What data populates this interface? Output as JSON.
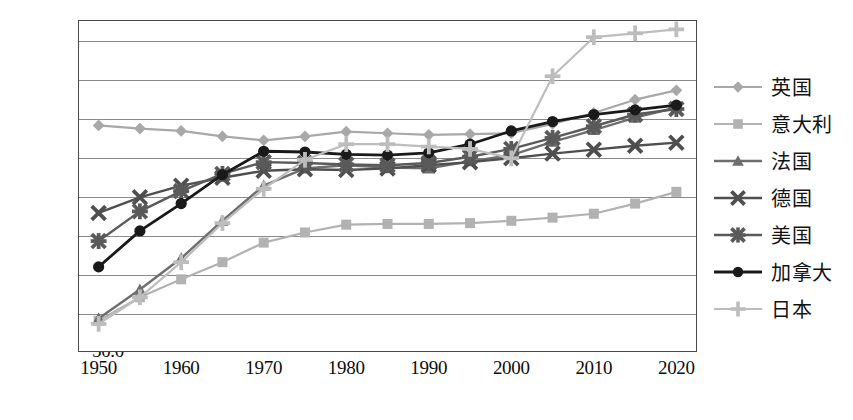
{
  "chart_data": {
    "type": "line",
    "title": "",
    "xlabel": "",
    "ylabel": "",
    "x": [
      1950,
      1955,
      1960,
      1965,
      1970,
      1975,
      1980,
      1985,
      1990,
      1995,
      2000,
      2005,
      2010,
      2015,
      2020
    ],
    "xlim": [
      1947.5,
      2022.5
    ],
    "ylim": [
      50.0,
      92.5
    ],
    "grid": true,
    "legend_position": "right",
    "y_ticks": [
      "90.0",
      "85.0",
      "80.0",
      "75.0",
      "70.0",
      "65.0",
      "60.0",
      "55.0",
      "50.0"
    ],
    "y_tick_values": [
      90.0,
      85.0,
      80.0,
      75.0,
      70.0,
      65.0,
      60.0,
      55.0,
      50.0
    ],
    "x_ticks": [
      "1950",
      "1960",
      "1970",
      "1980",
      "1990",
      "2000",
      "2010",
      "2020"
    ],
    "x_tick_values": [
      1950,
      1960,
      1970,
      1980,
      1990,
      2000,
      2010,
      2020
    ],
    "series": [
      {
        "name": "英国",
        "marker": "diamond",
        "color": "#a8a8a8",
        "line_width": 2.2,
        "values": [
          79.0,
          78.6,
          78.3,
          77.6,
          77.1,
          77.6,
          78.2,
          78.0,
          77.8,
          77.9,
          78.0,
          79.2,
          80.6,
          82.3,
          83.5
        ]
      },
      {
        "name": "意大利",
        "marker": "square",
        "color": "#b2b2b2",
        "line_width": 2.2,
        "values": [
          54.0,
          57.0,
          59.3,
          61.5,
          64.0,
          65.3,
          66.3,
          66.4,
          66.4,
          66.5,
          66.8,
          67.2,
          67.7,
          69.0,
          70.5
        ]
      },
      {
        "name": "法国",
        "marker": "triangle",
        "color": "#6e6e6e",
        "line_width": 2.4,
        "values": [
          54.3,
          58.0,
          62.0,
          66.8,
          71.3,
          73.5,
          73.9,
          73.6,
          73.5,
          74.4,
          75.2,
          76.9,
          78.4,
          80.0,
          81.3
        ]
      },
      {
        "name": "德国",
        "marker": "x",
        "color": "#4f4f4f",
        "line_width": 2.4,
        "values": [
          67.8,
          69.8,
          71.3,
          72.3,
          73.2,
          73.4,
          73.3,
          73.5,
          73.9,
          74.3,
          74.8,
          75.4,
          75.9,
          76.4,
          76.8
        ]
      },
      {
        "name": "美国",
        "marker": "asterisk",
        "color": "#5a5a5a",
        "line_width": 2.4,
        "values": [
          64.2,
          68.0,
          70.6,
          72.8,
          74.3,
          74.2,
          74.0,
          73.9,
          74.2,
          75.0,
          76.0,
          77.4,
          78.9,
          80.4,
          81.1
        ]
      },
      {
        "name": "加拿大",
        "marker": "circle",
        "color": "#1a1a1a",
        "line_width": 2.8,
        "values": [
          60.9,
          65.5,
          69.0,
          72.7,
          75.7,
          75.6,
          75.3,
          75.2,
          75.5,
          76.6,
          78.3,
          79.5,
          80.4,
          81.0,
          81.6
        ]
      },
      {
        "name": "日本",
        "marker": "plus",
        "color": "#bdbdbd",
        "line_width": 2.2,
        "values": [
          53.6,
          57.0,
          61.5,
          66.5,
          70.9,
          74.6,
          76.6,
          76.6,
          76.3,
          76.0,
          74.8,
          85.3,
          90.3,
          90.8,
          91.3
        ]
      }
    ]
  },
  "legend": {
    "items": [
      {
        "label": "英国"
      },
      {
        "label": "意大利"
      },
      {
        "label": "法国"
      },
      {
        "label": "德国"
      },
      {
        "label": "美国"
      },
      {
        "label": "加拿大"
      },
      {
        "label": "日本"
      }
    ]
  }
}
